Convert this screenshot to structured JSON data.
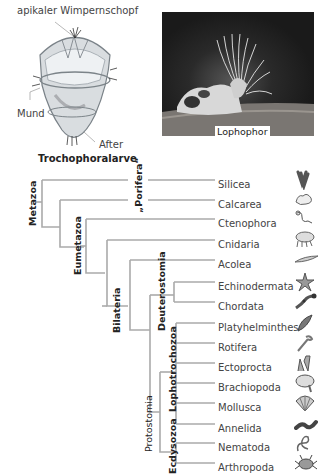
{
  "larva": {
    "labels": {
      "apical": "apikaler Wimpernschopf",
      "mouth": "Mund",
      "anus": "After"
    },
    "caption": "Trochophoralarve"
  },
  "photo": {
    "caption": "Lophophor"
  },
  "tree": {
    "groups": {
      "metazoa": "Metazoa",
      "porifera": "„Porifera“",
      "eumetazoa": "Eumetazoa",
      "bilateria": "Bilateria",
      "deuterostomia": "Deuterostomia",
      "protostomia": "Protostomia",
      "lophotrochozoa": "Lophotrochozoa",
      "ecdysozoa": "Ecdysozoa"
    },
    "taxa": [
      {
        "name": "Silicea",
        "icon": "sponge-tube-icon"
      },
      {
        "name": "Calcarea",
        "icon": "calcareous-sponge-icon"
      },
      {
        "name": "Ctenophora",
        "icon": "comb-jelly-icon"
      },
      {
        "name": "Cnidaria",
        "icon": "jellyfish-icon"
      },
      {
        "name": "Acolea",
        "icon": "flatworm-acoel-icon"
      },
      {
        "name": "Echinodermata",
        "icon": "starfish-icon"
      },
      {
        "name": "Chordata",
        "icon": "salamander-icon"
      },
      {
        "name": "Platyhelminthes",
        "icon": "flatworm-icon"
      },
      {
        "name": "Rotifera",
        "icon": "rotifer-icon"
      },
      {
        "name": "Ectoprocta",
        "icon": "bryozoan-icon"
      },
      {
        "name": "Brachiopoda",
        "icon": "brachiopod-icon"
      },
      {
        "name": "Mollusca",
        "icon": "shell-icon"
      },
      {
        "name": "Annelida",
        "icon": "worm-icon"
      },
      {
        "name": "Nematoda",
        "icon": "nematode-icon"
      },
      {
        "name": "Arthropoda",
        "icon": "crab-icon"
      }
    ]
  }
}
